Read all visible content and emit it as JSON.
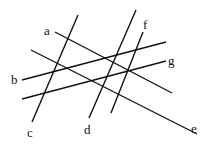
{
  "diagram": {
    "type": "line-arrangement",
    "lines": [
      {
        "label": "a",
        "x1": 55,
        "y1": 32,
        "x2": 172,
        "y2": 93,
        "lx": 44,
        "ly": 35
      },
      {
        "label": "b",
        "x1": 22,
        "y1": 80,
        "x2": 166,
        "y2": 42,
        "lx": 11,
        "ly": 84
      },
      {
        "label": "c",
        "x1": 78,
        "y1": 15,
        "x2": 32,
        "y2": 122,
        "lx": 27,
        "ly": 137
      },
      {
        "label": "d",
        "x1": 136,
        "y1": 10,
        "x2": 89,
        "y2": 118,
        "lx": 84,
        "ly": 134
      },
      {
        "label": "e",
        "x1": 31,
        "y1": 50,
        "x2": 197,
        "y2": 134,
        "lx": 191,
        "ly": 133
      },
      {
        "label": "f",
        "x1": 143,
        "y1": 32,
        "x2": 111,
        "y2": 113,
        "lx": 143,
        "ly": 29
      },
      {
        "label": "g",
        "x1": 22,
        "y1": 99,
        "x2": 166,
        "y2": 61,
        "lx": 168,
        "ly": 65
      }
    ]
  }
}
